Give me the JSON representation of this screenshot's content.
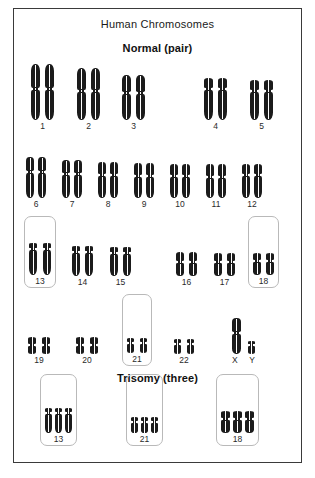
{
  "figure": {
    "title": "Human Chromosomes",
    "sections": [
      {
        "heading": "Normal (pair)"
      },
      {
        "heading": "Trisomy (three)"
      }
    ]
  },
  "normal": {
    "rows": [
      {
        "row_id": "row-1",
        "groups": [
          {
            "label": "1",
            "count": 2,
            "boxed": false,
            "left": 17,
            "arm_w": 9,
            "upper_h": 24,
            "lower_h": 30,
            "gap": 5
          },
          {
            "label": "2",
            "count": 2,
            "boxed": false,
            "left": 63,
            "arm_w": 9,
            "upper_h": 22,
            "lower_h": 28,
            "gap": 5
          },
          {
            "label": "3",
            "count": 2,
            "boxed": false,
            "left": 108,
            "arm_w": 9,
            "upper_h": 17,
            "lower_h": 26,
            "gap": 5
          },
          {
            "label": "4",
            "count": 2,
            "boxed": false,
            "left": 190,
            "arm_w": 9,
            "upper_h": 10,
            "lower_h": 30,
            "gap": 5
          },
          {
            "label": "5",
            "count": 2,
            "boxed": false,
            "left": 236,
            "arm_w": 9,
            "upper_h": 10,
            "lower_h": 28,
            "gap": 5
          }
        ]
      },
      {
        "row_id": "row-2",
        "groups": [
          {
            "label": "6",
            "count": 2,
            "boxed": false,
            "left": 12,
            "arm_w": 8,
            "upper_h": 14,
            "lower_h": 25,
            "gap": 4
          },
          {
            "label": "7",
            "count": 2,
            "boxed": false,
            "left": 48,
            "arm_w": 8,
            "upper_h": 13,
            "lower_h": 23,
            "gap": 4
          },
          {
            "label": "8",
            "count": 2,
            "boxed": false,
            "left": 84,
            "arm_w": 8,
            "upper_h": 12,
            "lower_h": 22,
            "gap": 4
          },
          {
            "label": "9",
            "count": 2,
            "boxed": false,
            "left": 120,
            "arm_w": 8,
            "upper_h": 12,
            "lower_h": 21,
            "gap": 4
          },
          {
            "label": "10",
            "count": 2,
            "boxed": false,
            "left": 156,
            "arm_w": 8,
            "upper_h": 11,
            "lower_h": 21,
            "gap": 4
          },
          {
            "label": "11",
            "count": 2,
            "boxed": false,
            "left": 192,
            "arm_w": 8,
            "upper_h": 12,
            "lower_h": 20,
            "gap": 4
          },
          {
            "label": "12",
            "count": 2,
            "boxed": false,
            "left": 228,
            "arm_w": 8,
            "upper_h": 10,
            "lower_h": 22,
            "gap": 4
          }
        ]
      },
      {
        "row_id": "row-3",
        "groups": [
          {
            "label": "13",
            "count": 2,
            "boxed": true,
            "left": 10,
            "arm_w": 8,
            "upper_h": 5,
            "lower_h": 25,
            "gap": 6
          },
          {
            "label": "14",
            "count": 2,
            "boxed": false,
            "left": 58,
            "arm_w": 8,
            "upper_h": 5,
            "lower_h": 23,
            "gap": 5
          },
          {
            "label": "15",
            "count": 2,
            "boxed": false,
            "left": 96,
            "arm_w": 8,
            "upper_h": 5,
            "lower_h": 22,
            "gap": 5
          },
          {
            "label": "16",
            "count": 2,
            "boxed": false,
            "left": 162,
            "arm_w": 8,
            "upper_h": 9,
            "lower_h": 13,
            "gap": 5
          },
          {
            "label": "17",
            "count": 2,
            "boxed": false,
            "left": 200,
            "arm_w": 8,
            "upper_h": 8,
            "lower_h": 13,
            "gap": 5
          },
          {
            "label": "18",
            "count": 2,
            "boxed": true,
            "left": 234,
            "arm_w": 8,
            "upper_h": 7,
            "lower_h": 13,
            "gap": 5
          }
        ]
      },
      {
        "row_id": "row-4",
        "groups": [
          {
            "label": "19",
            "count": 2,
            "boxed": false,
            "left": 14,
            "arm_w": 8,
            "upper_h": 7,
            "lower_h": 8,
            "gap": 6
          },
          {
            "label": "20",
            "count": 2,
            "boxed": false,
            "left": 62,
            "arm_w": 8,
            "upper_h": 7,
            "lower_h": 8,
            "gap": 6
          },
          {
            "label": "21",
            "count": 2,
            "boxed": true,
            "left": 108,
            "arm_w": 7,
            "upper_h": 4,
            "lower_h": 9,
            "gap": 6
          },
          {
            "label": "22",
            "count": 2,
            "boxed": false,
            "left": 160,
            "arm_w": 7,
            "upper_h": 4,
            "lower_h": 9,
            "gap": 6
          }
        ],
        "sex_pair": {
          "left": 218,
          "x_label": "X",
          "y_label": "Y",
          "x": {
            "arm_w": 9,
            "upper_h": 14,
            "lower_h": 20
          },
          "y": {
            "arm_w": 7,
            "upper_h": 3,
            "lower_h": 8
          }
        }
      }
    ]
  },
  "trisomy": {
    "groups": [
      {
        "label": "13",
        "count": 3,
        "boxed": true,
        "left": 26,
        "arm_w": 7,
        "upper_h": 4,
        "lower_h": 19,
        "gap": 3
      },
      {
        "label": "21",
        "count": 3,
        "boxed": true,
        "left": 112,
        "arm_w": 7,
        "upper_h": 4,
        "lower_h": 10,
        "gap": 3
      },
      {
        "label": "18",
        "count": 3,
        "boxed": true,
        "left": 202,
        "arm_w": 9,
        "upper_h": 7,
        "lower_h": 13,
        "gap": 3
      }
    ]
  },
  "bottom_caption": ""
}
